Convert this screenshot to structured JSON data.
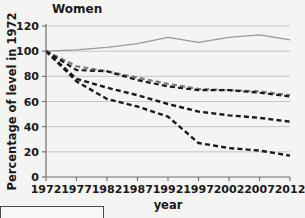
{
  "chart_data": {
    "type": "line",
    "title": "Women",
    "xlabel": "year",
    "ylabel": "Percentage of level in 1972",
    "xlim": [
      1972,
      2012
    ],
    "ylim": [
      0,
      120
    ],
    "grid": true,
    "legend_position": "below-left-cropped",
    "x_ticks": [
      1972,
      1977,
      1982,
      1987,
      1992,
      1997,
      2002,
      2007,
      2012
    ],
    "y_ticks": [
      0,
      20,
      40,
      60,
      80,
      100,
      120
    ],
    "x": [
      1972,
      1977,
      1982,
      1987,
      1992,
      1997,
      2002,
      2007,
      2012
    ],
    "series": [
      {
        "name": "solid-grey-series",
        "style": "solid",
        "color": "#9a9a9a",
        "width": 1.3,
        "values": [
          100,
          101,
          103,
          106,
          111,
          107,
          111,
          113,
          109
        ]
      },
      {
        "name": "dashed-grey-upper-series",
        "style": "dashed",
        "color": "#7b7b7b",
        "width": 2.2,
        "values": [
          100,
          88,
          84,
          79,
          74,
          70,
          69,
          68,
          65
        ]
      },
      {
        "name": "dashed-black-upper-series",
        "style": "dashed",
        "color": "#1a1a1a",
        "width": 2.2,
        "values": [
          100,
          85,
          84,
          77,
          72,
          69,
          69,
          67,
          64
        ]
      },
      {
        "name": "dashed-black-middle-series",
        "style": "dashed",
        "color": "#1a1a1a",
        "width": 2.4,
        "values": [
          100,
          78,
          71,
          65,
          58,
          52,
          49,
          47,
          44
        ]
      },
      {
        "name": "dashed-black-lower-series",
        "style": "dashed",
        "color": "#1a1a1a",
        "width": 2.4,
        "values": [
          100,
          76,
          62,
          56,
          48,
          27,
          23,
          21,
          17
        ]
      }
    ]
  },
  "legend": {
    "cropped_label": ""
  }
}
